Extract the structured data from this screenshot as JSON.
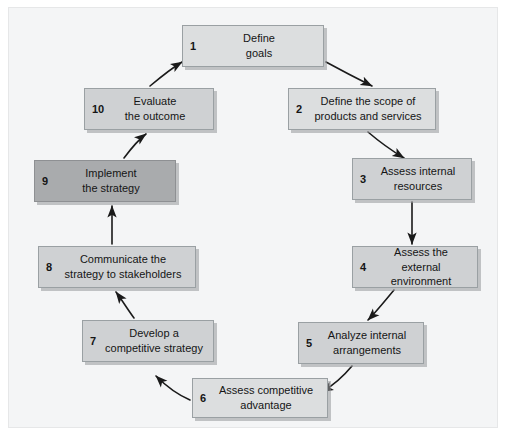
{
  "diagram": {
    "type": "cycle-flowchart",
    "background_color": "#f4f5f6",
    "box_color": "#d2d4d6",
    "highlight_box_color": "#a9abad",
    "arrow_color": "#1a1a1a",
    "steps": [
      {
        "number": "1",
        "label": "Define\ngoals",
        "shade": "shade-light",
        "x": 182,
        "y": 25,
        "w": 142,
        "h": 42
      },
      {
        "number": "2",
        "label": "Define the scope of\nproducts and services",
        "shade": "shade-light",
        "x": 288,
        "y": 88,
        "w": 148,
        "h": 42
      },
      {
        "number": "3",
        "label": "Assess internal\nresources",
        "shade": "shade-mid",
        "x": 352,
        "y": 158,
        "w": 120,
        "h": 42
      },
      {
        "number": "4",
        "label": "Assess the\nexternal environment",
        "shade": "shade-mid",
        "x": 352,
        "y": 246,
        "w": 126,
        "h": 42
      },
      {
        "number": "5",
        "label": "Analyze internal\narrangements",
        "shade": "shade-mid",
        "x": 298,
        "y": 322,
        "w": 126,
        "h": 42
      },
      {
        "number": "6",
        "label": "Assess competitive\nadvantage",
        "shade": "shade-light",
        "x": 192,
        "y": 378,
        "w": 136,
        "h": 40
      },
      {
        "number": "7",
        "label": "Develop a\ncompetitive strategy",
        "shade": "shade-mid",
        "x": 82,
        "y": 320,
        "w": 132,
        "h": 42
      },
      {
        "number": "8",
        "label": "Communicate the\nstrategy to stakeholders",
        "shade": "shade-mid",
        "x": 38,
        "y": 246,
        "w": 158,
        "h": 42
      },
      {
        "number": "9",
        "label": "Implement\nthe strategy",
        "shade": "shade-dark",
        "x": 34,
        "y": 160,
        "w": 142,
        "h": 42
      },
      {
        "number": "10",
        "label": "Evaluate\nthe outcome",
        "shade": "shade-mid",
        "x": 84,
        "y": 88,
        "w": 130,
        "h": 42
      }
    ],
    "connections": [
      {
        "from": "1",
        "to": "2",
        "path": "M 326 62 C 348 74 360 80 372 86"
      },
      {
        "from": "2",
        "to": "3",
        "path": "M 368 132 C 382 144 394 152 404 158"
      },
      {
        "from": "3",
        "to": "4",
        "path": "M 412 202 L 412 244"
      },
      {
        "from": "4",
        "to": "5",
        "path": "M 394 290 C 384 302 376 312 368 320"
      },
      {
        "from": "5",
        "to": "6",
        "path": "M 352 366 C 342 378 332 386 322 392"
      },
      {
        "from": "6",
        "to": "7",
        "path": "M 190 400 C 176 394 166 386 156 376"
      },
      {
        "from": "7",
        "to": "8",
        "path": "M 134 318 C 128 310 122 300 116 292"
      },
      {
        "from": "8",
        "to": "9",
        "path": "M 112 244 L 112 206"
      },
      {
        "from": "9",
        "to": "10",
        "path": "M 124 158 C 130 150 138 140 146 134"
      },
      {
        "from": "10",
        "to": "1",
        "path": "M 150 86 C 162 76 172 68 182 62"
      }
    ]
  }
}
